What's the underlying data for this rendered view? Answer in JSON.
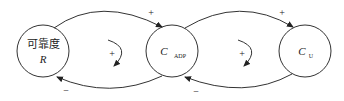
{
  "nodes": [
    {
      "id": "R",
      "line1": "可靠度",
      "line2": "R"
    },
    {
      "id": "CADP",
      "main": "C",
      "sub": "ADP"
    },
    {
      "id": "CU",
      "main": "C",
      "sub": "U"
    }
  ],
  "edges": [
    {
      "from": "R",
      "to": "CADP",
      "sign": "+"
    },
    {
      "from": "CADP",
      "to": "R",
      "sign": "−"
    },
    {
      "from": "CADP",
      "to": "CU",
      "sign": "+"
    },
    {
      "from": "CU",
      "to": "CADP",
      "sign": "−"
    }
  ],
  "loops": [
    {
      "between": "R-CADP",
      "polarity": "+"
    },
    {
      "between": "CADP-CU",
      "polarity": "+"
    }
  ]
}
